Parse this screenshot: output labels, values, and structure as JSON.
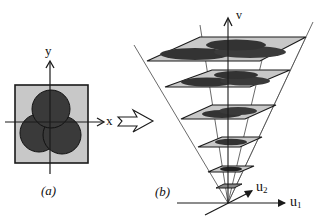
{
  "panel_a": {
    "caption": "(a)",
    "x_axis_label": "x",
    "y_axis_label": "y",
    "square_fill": "#c8c8c8",
    "disk_fill": "#3a3a3a",
    "disk_count": 3
  },
  "transition_arrow": {
    "style": "hollow"
  },
  "panel_b": {
    "caption": "(b)",
    "vertical_axis_label": "v",
    "u1_label": "u",
    "u1_sub": "1",
    "u2_label": "u",
    "u2_sub": "2",
    "plane_fill": "#c8c8c8",
    "blob_fill": "#3a3a3a",
    "plane_count": 6
  },
  "colors": {
    "line": "#1a1a1a",
    "plane": "#c8c8c8",
    "shape": "#3a3a3a",
    "background": "#ffffff"
  }
}
